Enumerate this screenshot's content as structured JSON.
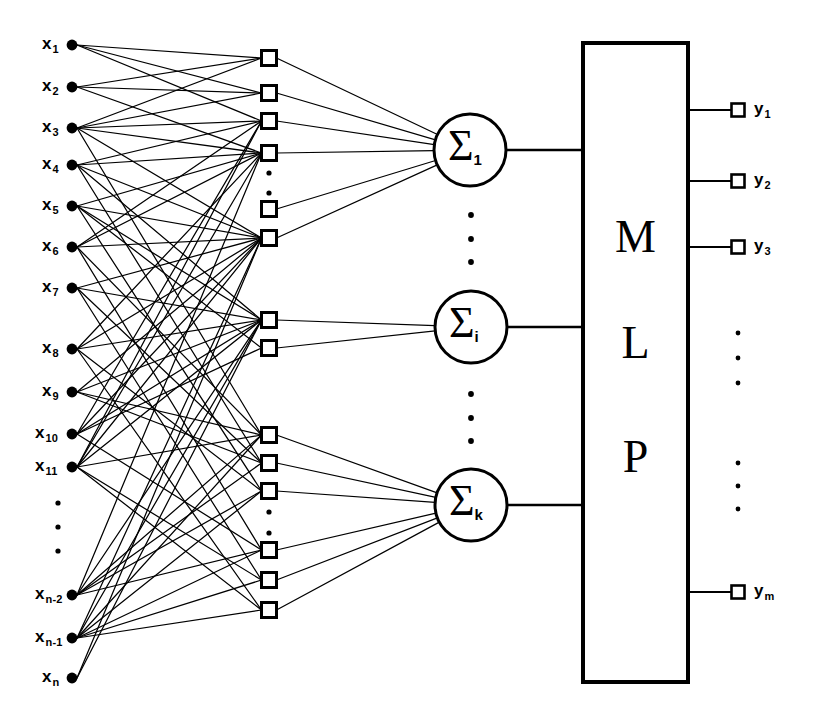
{
  "figure": {
    "type": "diagram",
    "stroke_color": "#000000",
    "background_color": "#ffffff"
  },
  "input_layer": {
    "name": "input-nodes",
    "marker": "filled-circle",
    "node_x": 72,
    "nodes": [
      {
        "base": "x",
        "sub": "1",
        "y": 45
      },
      {
        "base": "x",
        "sub": "2",
        "y": 87
      },
      {
        "base": "x",
        "sub": "3",
        "y": 128
      },
      {
        "base": "x",
        "sub": "4",
        "y": 165
      },
      {
        "base": "x",
        "sub": "5",
        "y": 206
      },
      {
        "base": "x",
        "sub": "6",
        "y": 247
      },
      {
        "base": "x",
        "sub": "7",
        "y": 288
      },
      {
        "base": "x",
        "sub": "8",
        "y": 349
      },
      {
        "base": "x",
        "sub": "9",
        "y": 392
      },
      {
        "base": "x",
        "sub": "10",
        "y": 434
      },
      {
        "base": "x",
        "sub": "11",
        "y": 467
      },
      {
        "base": "x",
        "sub": "n-2",
        "y": 595
      },
      {
        "base": "x",
        "sub": "n-1",
        "y": 638
      },
      {
        "base": "x",
        "sub": "n",
        "y": 678
      }
    ],
    "ellipsis": {
      "x": 58,
      "dots_y": [
        503,
        527,
        551
      ]
    }
  },
  "hidden_layer": {
    "name": "hidden-nodes",
    "marker": "open-square",
    "node_x": 269,
    "size": 15,
    "nodes_y": [
      58,
      93,
      121,
      153,
      209,
      238,
      320,
      348,
      435,
      463,
      491,
      550,
      580,
      610
    ],
    "ellipses": [
      {
        "x": 269,
        "dots_y": [
          173,
          193
        ]
      },
      {
        "x": 269,
        "dots_y": [
          512,
          533
        ]
      }
    ]
  },
  "summation_layer": {
    "name": "summation-nodes",
    "marker": "circle",
    "radius": 36,
    "nodes": [
      {
        "symbol": "Σ",
        "sub": "1",
        "cx": 470,
        "cy": 150
      },
      {
        "symbol": "Σ",
        "sub": "i",
        "cx": 471,
        "cy": 327
      },
      {
        "symbol": "Σ",
        "sub": "k",
        "cx": 471,
        "cy": 505
      }
    ],
    "ellipses": [
      {
        "x": 471,
        "dots_y": [
          215,
          239,
          262
        ]
      },
      {
        "x": 471,
        "dots_y": [
          394,
          418,
          441
        ]
      }
    ]
  },
  "mlp_block": {
    "name": "mlp-box",
    "label_letters": [
      "M",
      "L",
      "P"
    ],
    "letters_y": [
      214,
      320,
      434
    ],
    "x": 583,
    "y": 43,
    "width": 105,
    "height": 639
  },
  "output_layer": {
    "name": "output-nodes",
    "marker": "open-square",
    "node_x": 738,
    "size": 13,
    "nodes": [
      {
        "base": "y",
        "sub": "1",
        "y": 110
      },
      {
        "base": "y",
        "sub": "2",
        "y": 181
      },
      {
        "base": "y",
        "sub": "3",
        "y": 247
      },
      {
        "base": "y",
        "sub": "m",
        "y": 592
      }
    ],
    "ellipses": [
      {
        "x": 738,
        "dots_y": [
          333,
          358,
          383
        ]
      },
      {
        "x": 738,
        "dots_y": [
          463,
          486,
          509
        ]
      }
    ]
  },
  "edges": {
    "input_to_hidden": [
      [
        0,
        0
      ],
      [
        0,
        1
      ],
      [
        0,
        2
      ],
      [
        1,
        0
      ],
      [
        1,
        1
      ],
      [
        1,
        3
      ],
      [
        2,
        0
      ],
      [
        2,
        1
      ],
      [
        2,
        2
      ],
      [
        2,
        3
      ],
      [
        2,
        5
      ],
      [
        2,
        8
      ],
      [
        3,
        2
      ],
      [
        3,
        3
      ],
      [
        3,
        5
      ],
      [
        3,
        6
      ],
      [
        3,
        9
      ],
      [
        4,
        3
      ],
      [
        4,
        5
      ],
      [
        4,
        6
      ],
      [
        4,
        7
      ],
      [
        4,
        10
      ],
      [
        5,
        2
      ],
      [
        5,
        3
      ],
      [
        5,
        5
      ],
      [
        5,
        8
      ],
      [
        5,
        11
      ],
      [
        6,
        5
      ],
      [
        6,
        6
      ],
      [
        6,
        9
      ],
      [
        6,
        12
      ],
      [
        7,
        3
      ],
      [
        7,
        5
      ],
      [
        7,
        6
      ],
      [
        7,
        10
      ],
      [
        7,
        13
      ],
      [
        8,
        5
      ],
      [
        8,
        6
      ],
      [
        8,
        8
      ],
      [
        8,
        9
      ],
      [
        9,
        2
      ],
      [
        9,
        5
      ],
      [
        9,
        6
      ],
      [
        9,
        7
      ],
      [
        9,
        11
      ],
      [
        10,
        2
      ],
      [
        10,
        3
      ],
      [
        10,
        5
      ],
      [
        10,
        6
      ],
      [
        10,
        8
      ],
      [
        10,
        12
      ],
      [
        10,
        13
      ],
      [
        11,
        3
      ],
      [
        11,
        6
      ],
      [
        11,
        8
      ],
      [
        11,
        9
      ],
      [
        11,
        10
      ],
      [
        11,
        11
      ],
      [
        12,
        5
      ],
      [
        12,
        6
      ],
      [
        12,
        8
      ],
      [
        12,
        10
      ],
      [
        12,
        11
      ],
      [
        12,
        12
      ],
      [
        12,
        13
      ],
      [
        13,
        5
      ],
      [
        13,
        6
      ]
    ],
    "hidden_to_sum": [
      [
        0,
        0
      ],
      [
        1,
        0
      ],
      [
        2,
        0
      ],
      [
        3,
        0
      ],
      [
        4,
        0
      ],
      [
        5,
        0
      ],
      [
        6,
        1
      ],
      [
        7,
        1
      ],
      [
        8,
        2
      ],
      [
        9,
        2
      ],
      [
        10,
        2
      ],
      [
        11,
        2
      ],
      [
        12,
        2
      ],
      [
        13,
        2
      ]
    ],
    "sum_to_mlp": [
      0,
      1,
      2
    ],
    "mlp_to_output": [
      0,
      1,
      2,
      3
    ]
  }
}
